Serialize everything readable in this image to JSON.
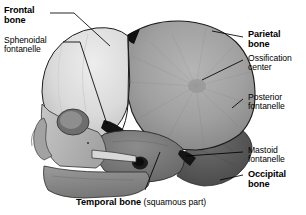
{
  "figure": {
    "view": "lateral"
  },
  "labels": {
    "frontal_bone": {
      "line1": "Frontal",
      "line2": "bone",
      "weight": "bold"
    },
    "sphenoidal_fontanelle": {
      "line1": "Sphenoidal",
      "line2": "fontanelle",
      "weight": "regular"
    },
    "parietal_bone": {
      "line1": "Parietal",
      "line2": "bone",
      "weight": "bold"
    },
    "ossification_center": {
      "line1": "Ossification",
      "line2": "center",
      "weight": "regular"
    },
    "posterior_fontanelle": {
      "line1": "Posterior",
      "line2": "fontanelle",
      "weight": "regular"
    },
    "mastoid_fontanelle": {
      "line1": "Mastoid",
      "line2": "fontanelle",
      "weight": "regular"
    },
    "occipital_bone": {
      "line1": "Occipital",
      "line2": "bone",
      "weight": "bold"
    },
    "temporal_bone": {
      "bold_part": "Temporal bone",
      "normal_part": " (squamous part)"
    }
  },
  "colors": {
    "background": "#ffffff",
    "text": "#000000",
    "leader_line": "#000000",
    "frontal_bone": "#e2e2e2",
    "parietal_bone": "#9e9e9e",
    "occipital_bone": "#585858",
    "temporal_bone": "#767676",
    "facial_bones": "#b4b4b4",
    "mandible": "#8a8a8a",
    "suture_dark": "#111111"
  }
}
